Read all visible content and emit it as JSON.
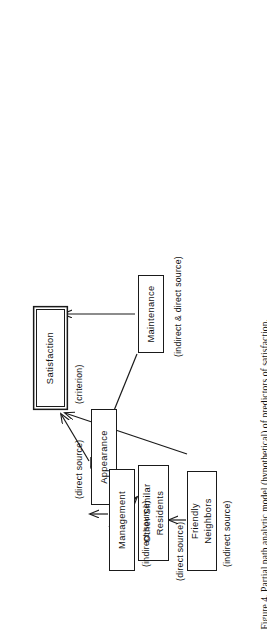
{
  "figure": {
    "caption": "Figure 4.  Partial path analytic model (hypothetical) of predictors of satisfaction.",
    "caption_number": "Figure 4.",
    "orientation": "rotated-90-ccw",
    "page_width": 267,
    "page_height": 638,
    "ink_color": "#1a1a1a",
    "background_color": "#ffffff"
  },
  "diagram": {
    "type": "path-analytic-model",
    "nodes": [
      {
        "id": "satisfaction",
        "label": "Satisfaction",
        "role": "criterion",
        "annotation": "(criterion)",
        "emphasis": "double-border"
      },
      {
        "id": "appearance",
        "label": "Appearance",
        "role": "direct-predictor",
        "annotation": "(direct source)",
        "emphasis": "single-border"
      },
      {
        "id": "other_similar",
        "label": "Other Similar\nResidents",
        "role": "direct-predictor",
        "annotation": "(direct source)",
        "emphasis": "single-border"
      },
      {
        "id": "maintenance",
        "label": "Maintenance",
        "role": "mixed-predictor",
        "annotation": "(indirect & direct source)",
        "emphasis": "single-border"
      },
      {
        "id": "management",
        "label": "Management",
        "role": "indirect-predictor",
        "annotation": "(indirect source)",
        "emphasis": "single-border"
      },
      {
        "id": "friendly",
        "label": "Friendly\nNeighbors",
        "role": "indirect-predictor",
        "annotation": "(indirect source)",
        "emphasis": "single-border"
      }
    ],
    "edges": [
      {
        "from": "appearance",
        "to": "satisfaction",
        "kind": "direct"
      },
      {
        "from": "maintenance",
        "to": "satisfaction",
        "kind": "direct"
      },
      {
        "from": "other_similar",
        "to": "satisfaction",
        "kind": "direct"
      },
      {
        "from": "management",
        "to": "appearance",
        "kind": "indirect"
      },
      {
        "from": "management",
        "to": "maintenance",
        "kind": "indirect"
      },
      {
        "from": "maintenance",
        "to": "appearance",
        "kind": "indirect"
      },
      {
        "from": "friendly",
        "to": "other_similar",
        "kind": "indirect"
      }
    ],
    "annotations": {
      "criterion": "(criterion)",
      "direct_source": "(direct source)",
      "indirect_source": "(indirect source)",
      "indirect_and_direct_source": "(indirect & direct source)"
    },
    "labels": {
      "satisfaction": "Satisfaction",
      "appearance": "Appearance",
      "other_similar_line1": "Other Similar",
      "other_similar_line2": "Residents",
      "maintenance": "Maintenance",
      "management": "Management",
      "friendly_line1": "Friendly",
      "friendly_line2": "Neighbors"
    }
  }
}
